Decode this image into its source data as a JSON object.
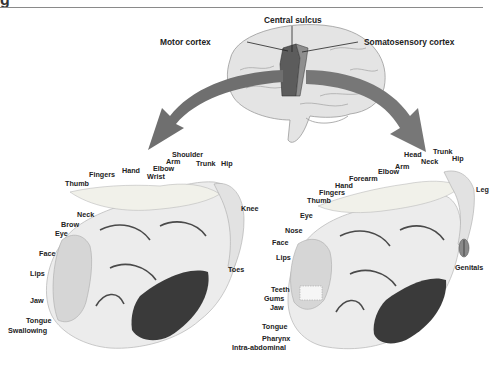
{
  "figure": {
    "header_glyph": "g",
    "colors": {
      "arrow": "#6f6f6f",
      "motor_cortex": "#5c5c5c",
      "somatosensory_cortex": "#8e8e8e",
      "brain": "#e4e4e4",
      "section": "#ececec",
      "section_dark": "#3a3a3a",
      "text": "#222222",
      "rule": "#8a8a8a"
    },
    "brain_labels": {
      "central_sulcus": "Central sulcus",
      "motor_cortex": "Motor cortex",
      "somatosensory_cortex": "Somatosensory cortex"
    },
    "motor_homunculus": {
      "labels": [
        {
          "text": "Shoulder",
          "x": 172,
          "y": 154
        },
        {
          "text": "Arm",
          "x": 166,
          "y": 161
        },
        {
          "text": "Elbow",
          "x": 153,
          "y": 168
        },
        {
          "text": "Wrist",
          "x": 147,
          "y": 174
        },
        {
          "text": "Trunk",
          "x": 196,
          "y": 163
        },
        {
          "text": "Hip",
          "x": 221,
          "y": 163
        },
        {
          "text": "Hand",
          "x": 122,
          "y": 168
        },
        {
          "text": "Fingers",
          "x": 89,
          "y": 172
        },
        {
          "text": "Thumb",
          "x": 65,
          "y": 181
        },
        {
          "text": "Knee",
          "x": 241,
          "y": 207
        },
        {
          "text": "Neck",
          "x": 77,
          "y": 212
        },
        {
          "text": "Brow",
          "x": 61,
          "y": 221
        },
        {
          "text": "Eye",
          "x": 55,
          "y": 230
        },
        {
          "text": "Face",
          "x": 39,
          "y": 250
        },
        {
          "text": "Lips",
          "x": 30,
          "y": 270
        },
        {
          "text": "Toes",
          "x": 228,
          "y": 266
        },
        {
          "text": "Jaw",
          "x": 30,
          "y": 297
        },
        {
          "text": "Tongue",
          "x": 26,
          "y": 317
        },
        {
          "text": "Swallowing",
          "x": 8,
          "y": 327
        }
      ]
    },
    "sensory_homunculus": {
      "labels": [
        {
          "text": "Head",
          "x": 404,
          "y": 152
        },
        {
          "text": "Trunk",
          "x": 433,
          "y": 149
        },
        {
          "text": "Neck",
          "x": 421,
          "y": 158
        },
        {
          "text": "Hip",
          "x": 452,
          "y": 156
        },
        {
          "text": "Arm",
          "x": 395,
          "y": 163
        },
        {
          "text": "Elbow",
          "x": 378,
          "y": 168
        },
        {
          "text": "Forearm",
          "x": 349,
          "y": 175
        },
        {
          "text": "Hand",
          "x": 335,
          "y": 181
        },
        {
          "text": "Fingers",
          "x": 319,
          "y": 188
        },
        {
          "text": "Thumb",
          "x": 307,
          "y": 196
        },
        {
          "text": "Leg",
          "x": 476,
          "y": 187
        },
        {
          "text": "Eye",
          "x": 300,
          "y": 212
        },
        {
          "text": "Nose",
          "x": 285,
          "y": 228
        },
        {
          "text": "Face",
          "x": 272,
          "y": 239
        },
        {
          "text": "Lips",
          "x": 276,
          "y": 254
        },
        {
          "text": "Genitals",
          "x": 455,
          "y": 264
        },
        {
          "text": "Teeth",
          "x": 271,
          "y": 286
        },
        {
          "text": "Gums",
          "x": 264,
          "y": 295
        },
        {
          "text": "Jaw",
          "x": 270,
          "y": 304
        },
        {
          "text": "Tongue",
          "x": 262,
          "y": 323
        },
        {
          "text": "Pharynx",
          "x": 262,
          "y": 335
        },
        {
          "text": "Intra-abdominal",
          "x": 232,
          "y": 344
        }
      ]
    }
  }
}
